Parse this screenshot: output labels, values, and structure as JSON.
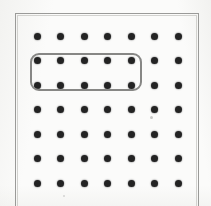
{
  "figure": {
    "kind": "dot-array-figure",
    "caption": "",
    "background_color": "#fbfbfa",
    "page_color": "#ffffff",
    "width": 211,
    "height": 206
  },
  "frame": {
    "label": "figure-border",
    "color": "#9a9a98",
    "stroke_width": 1,
    "left": 15,
    "top": 13,
    "right": 198,
    "bottom": 206,
    "bottom_visible": false
  },
  "grid": {
    "label": "dot-array",
    "rows": 7,
    "columns": 7,
    "total_dots": 49,
    "dot_color": "#232323",
    "dot_diameter": 7,
    "origin_x": 37,
    "origin_y": 36,
    "step_x": 23.5,
    "step_y": 24.5,
    "row_labels": [
      "1",
      "2",
      "3",
      "4",
      "5",
      "6",
      "7"
    ],
    "column_labels": [
      "1",
      "2",
      "3",
      "4",
      "5",
      "6",
      "7"
    ]
  },
  "selection": {
    "label": "grouped-dots-outline",
    "shape": "rounded-rectangle",
    "color": "#878785",
    "stroke_width": 2,
    "corner_radius": 9,
    "left": 30,
    "top": 53,
    "width": 112,
    "height": 38,
    "rows_covered": [
      2,
      3
    ],
    "columns_covered": [
      1,
      2,
      3,
      4,
      5
    ],
    "dots_enclosed": 10,
    "dots_enclosed_label": "10"
  },
  "artifacts": [
    {
      "name": "scan-smudge",
      "x": 151,
      "y": 117,
      "size": 3
    },
    {
      "name": "scan-speck",
      "x": 64,
      "y": 196,
      "size": 2
    }
  ]
}
